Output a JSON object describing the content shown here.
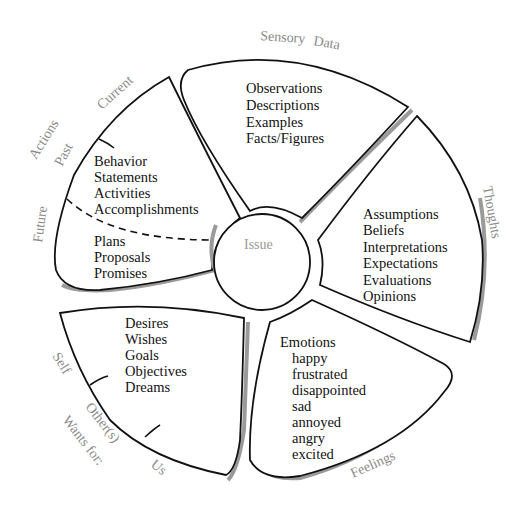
{
  "hub": {
    "label": "Issue"
  },
  "sensory_data": {
    "outer_label_1": "Sensory",
    "outer_label_2": "Data",
    "items": [
      "Observations",
      "Descriptions",
      "Examples",
      "Facts/Figures"
    ]
  },
  "thoughts": {
    "outer_label": "Thoughts",
    "items": [
      "Assumptions",
      "Beliefs",
      "Interpretations",
      "Expectations",
      "Evaluations",
      "Opinions"
    ]
  },
  "feelings": {
    "outer_label": "Feelings",
    "heading": "Emotions",
    "items": [
      "happy",
      "frustrated",
      "disappointed",
      "sad",
      "annoyed",
      "angry",
      "excited"
    ]
  },
  "wants": {
    "outer_label": "Wants for:",
    "sub_labels": [
      "Self",
      "Other(s)",
      "Us"
    ],
    "items": [
      "Desires",
      "Wishes",
      "Goals",
      "Objectives",
      "Dreams"
    ]
  },
  "actions": {
    "outer_label": "Actions",
    "sub_labels": [
      "Current",
      "Past",
      "Future"
    ],
    "past_items": [
      "Behavior",
      "Statements",
      "Activities",
      "Accomplishments"
    ],
    "future_items": [
      "Plans",
      "Proposals",
      "Promises"
    ]
  },
  "colors": {
    "line": "#111111",
    "shadow": "#9a9a9a",
    "outer_label": "#8a8a8a",
    "text": "#111111"
  }
}
